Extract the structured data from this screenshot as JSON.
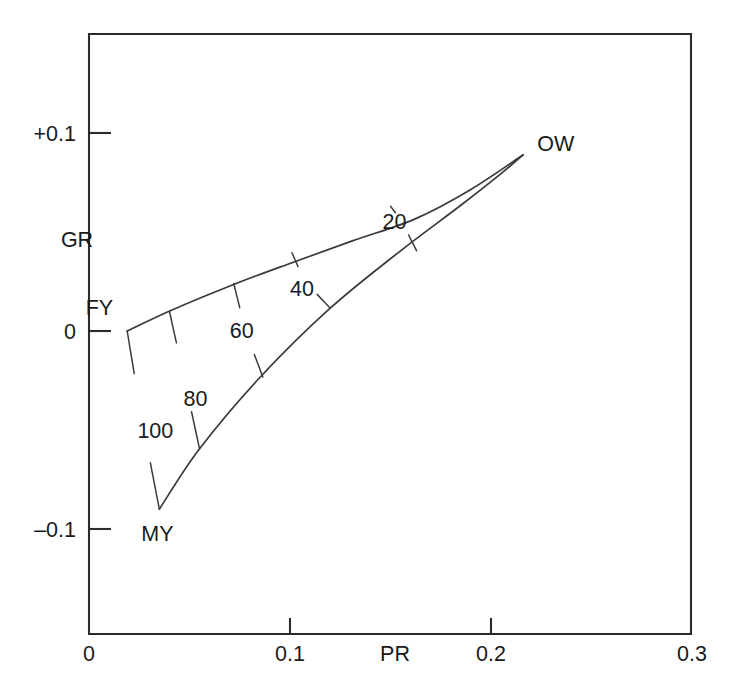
{
  "chart_data": {
    "type": "line",
    "title": "",
    "subtitle": "",
    "xlabel": "PR",
    "ylabel": "GR",
    "xlim": [
      0,
      0.3
    ],
    "ylim": [
      -0.15,
      0.135
    ],
    "grid": false,
    "legend": null,
    "x_ticks": [
      {
        "value": 0,
        "label": "0"
      },
      {
        "value": 0.1,
        "label": "0.1"
      },
      {
        "value": 0.2,
        "label": "0.2"
      },
      {
        "value": 0.3,
        "label": "0.3"
      }
    ],
    "y_ticks": [
      {
        "value": 0.1,
        "label": "+0.1"
      },
      {
        "value": 0,
        "label": "0"
      },
      {
        "value": -0.1,
        "label": "–0.1"
      }
    ],
    "annotations": [
      {
        "name": "FY",
        "text": "FY",
        "x": 0.019,
        "y": 0.0
      },
      {
        "name": "MY",
        "text": "MY",
        "x": 0.035,
        "y": -0.09
      },
      {
        "name": "OW",
        "text": "OW",
        "x": 0.216,
        "y": 0.089
      }
    ],
    "series": [
      {
        "name": "upper-boundary",
        "description": "Upper gamut edge from FY to OW",
        "points": [
          {
            "x": 0.019,
            "y": 0.0
          },
          {
            "x": 0.041,
            "y": 0.0105
          },
          {
            "x": 0.072,
            "y": 0.0235
          },
          {
            "x": 0.101,
            "y": 0.0345
          },
          {
            "x": 0.131,
            "y": 0.0455
          },
          {
            "x": 0.162,
            "y": 0.0565
          },
          {
            "x": 0.19,
            "y": 0.0715
          },
          {
            "x": 0.216,
            "y": 0.089
          }
        ]
      },
      {
        "name": "lower-boundary",
        "description": "Lower gamut edge from MY to OW",
        "points": [
          {
            "x": 0.035,
            "y": -0.09
          },
          {
            "x": 0.055,
            "y": -0.0595
          },
          {
            "x": 0.085,
            "y": -0.0235
          },
          {
            "x": 0.12,
            "y": 0.0115
          },
          {
            "x": 0.155,
            "y": 0.0405
          },
          {
            "x": 0.185,
            "y": 0.0635
          },
          {
            "x": 0.205,
            "y": 0.0795
          },
          {
            "x": 0.216,
            "y": 0.089
          }
        ]
      }
    ],
    "contours": [
      {
        "label": "100",
        "value": 100,
        "label_x": 0.033,
        "label_y": -0.05,
        "points": [
          {
            "x": 0.019,
            "y": 0.0
          },
          {
            "x": 0.026,
            "y": -0.043
          },
          {
            "x": 0.035,
            "y": -0.09
          }
        ]
      },
      {
        "label": "80",
        "value": 80,
        "label_x": 0.053,
        "label_y": -0.034,
        "points": [
          {
            "x": 0.04,
            "y": 0.01
          },
          {
            "x": 0.047,
            "y": -0.022
          },
          {
            "x": 0.055,
            "y": -0.0595
          }
        ]
      },
      {
        "label": "60",
        "value": 60,
        "label_x": 0.076,
        "label_y": 0.0005,
        "points": [
          {
            "x": 0.072,
            "y": 0.024
          },
          {
            "x": 0.078,
            "y": -0.0005
          },
          {
            "x": 0.0865,
            "y": -0.0232
          }
        ]
      },
      {
        "label": "40",
        "value": 40,
        "label_x": 0.106,
        "label_y": 0.0215,
        "points": [
          {
            "x": 0.101,
            "y": 0.0395
          },
          {
            "x": 0.107,
            "y": 0.0255
          },
          {
            "x": 0.12,
            "y": 0.0115
          }
        ]
      },
      {
        "label": "20",
        "value": 20,
        "label_x": 0.152,
        "label_y": 0.0555,
        "points": [
          {
            "x": 0.15,
            "y": 0.063
          },
          {
            "x": 0.155,
            "y": 0.0565
          },
          {
            "x": 0.163,
            "y": 0.0405
          }
        ]
      }
    ],
    "colors": {
      "axis": "#2b2b2b",
      "curve": "#3a3a3a",
      "text": "#1a1a1a",
      "background": "#ffffff"
    }
  }
}
